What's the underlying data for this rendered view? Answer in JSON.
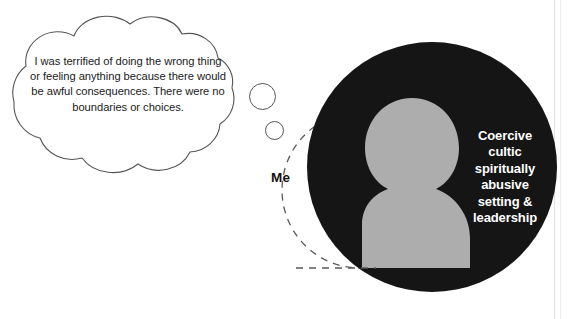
{
  "figure": {
    "thought_bubble": {
      "text": "I was terrified of doing the wrong thing or feeling anything because there would be awful consequences. There were no boundaries or choices."
    },
    "person_label": "Me",
    "circle_label_lines": [
      "Coercive",
      "cultic",
      "spiritually",
      "abusive",
      "setting &",
      "leadership"
    ],
    "colors": {
      "circle_fill": "#151515",
      "silhouette_fill": "#adadad",
      "circle_text": "#ffffff",
      "outline": "#555555",
      "dashed_outline": "#5a5a5a",
      "background": "#ffffff",
      "bubble_text": "#1b1b1b"
    }
  }
}
